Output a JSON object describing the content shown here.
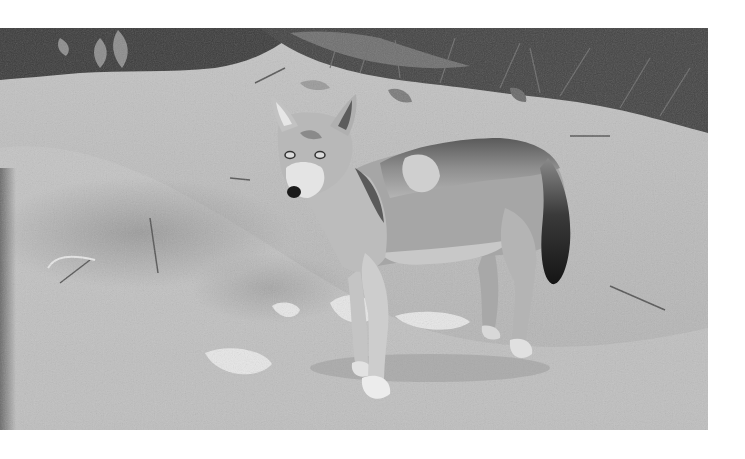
{
  "image": {
    "subject": "wolf",
    "description": "Grayscale photograph of a wolf standing on sandy ground, looking toward the camera, with grass and leafy vegetation along the top edge",
    "colors": {
      "background": "#ffffff",
      "ground": "#bdbdbd",
      "ground_light": "#d6d6d6",
      "vegetation": "#3a3a3a",
      "vegetation_mid": "#5e5e5e",
      "fur_light": "#d2d2d2",
      "fur_mid": "#9a9a9a",
      "fur_dark": "#4a4a4a",
      "tail_tip": "#1e1e1e",
      "puddle": "#e8e8e8"
    },
    "elements": [
      {
        "name": "vegetation",
        "label": "grass and leaves along top edge"
      },
      {
        "name": "ground",
        "label": "sandy dirt ground"
      },
      {
        "name": "puddles",
        "label": "light water patches on ground"
      },
      {
        "name": "wolf",
        "label": "wolf standing, head turned toward viewer"
      }
    ]
  }
}
